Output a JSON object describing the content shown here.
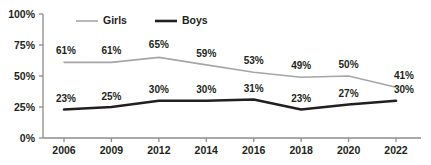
{
  "chart_data": {
    "type": "line",
    "title": "",
    "subtitle": "",
    "xlabel": "",
    "ylabel": "",
    "categories": [
      "2006",
      "2009",
      "2012",
      "2014",
      "2016",
      "2018",
      "2020",
      "2022"
    ],
    "series": [
      {
        "name": "Girls",
        "color": "#a6a6a6",
        "line_width": 1.6,
        "values": [
          61,
          61,
          65,
          59,
          53,
          49,
          50,
          41
        ],
        "labels": [
          "61%",
          "61%",
          "65%",
          "59%",
          "53%",
          "49%",
          "50%",
          "41%"
        ]
      },
      {
        "name": "Boys",
        "color": "#231f20",
        "line_width": 2.6,
        "values": [
          23,
          25,
          30,
          30,
          31,
          23,
          27,
          30
        ],
        "labels": [
          "23%",
          "25%",
          "30%",
          "30%",
          "31%",
          "23%",
          "27%",
          "30%"
        ]
      }
    ],
    "ylim": [
      0,
      100
    ],
    "y_ticks": [
      0,
      25,
      50,
      75,
      100
    ],
    "y_tick_labels": [
      "0%",
      "25%",
      "50%",
      "75%",
      "100%"
    ],
    "grid": false,
    "legend_position": "top-left",
    "axis_color": "#8c8c8c",
    "text_color": "#231f20",
    "background": "#ffffff"
  },
  "legend": {
    "items": [
      {
        "label": "Girls",
        "color": "#a6a6a6"
      },
      {
        "label": "Boys",
        "color": "#231f20"
      }
    ]
  }
}
